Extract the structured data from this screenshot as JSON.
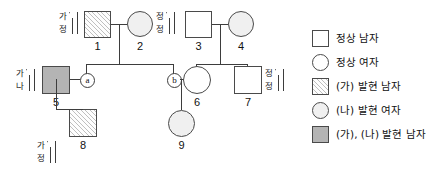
{
  "diagram": {
    "type": "pedigree-chart",
    "title": "",
    "individuals": [
      {
        "id": "1",
        "label": "1",
        "shape": "square",
        "sex": "male",
        "fill": "hatch",
        "phenotype": "(가) 발현 남자",
        "genotype_marker": {
          "position": "left",
          "top_allele": "가",
          "bottom_allele": "정",
          "chromosomes": [
            "Y",
            "X"
          ]
        }
      },
      {
        "id": "2",
        "label": "2",
        "shape": "circle",
        "sex": "female",
        "fill": "light",
        "phenotype": "(나) 발현 여자",
        "genotype_marker": null
      },
      {
        "id": "3",
        "label": "3",
        "shape": "square",
        "sex": "male",
        "fill": "open",
        "phenotype": "정상 남자",
        "genotype_marker": {
          "position": "left",
          "top_allele": "정",
          "bottom_allele": "정",
          "chromosomes": [
            "Y",
            "X"
          ]
        }
      },
      {
        "id": "4",
        "label": "4",
        "shape": "circle",
        "sex": "female",
        "fill": "light",
        "phenotype": "(나) 발현 여자",
        "genotype_marker": null
      },
      {
        "id": "5",
        "label": "5",
        "shape": "square",
        "sex": "male",
        "fill": "solid",
        "phenotype": "(가), (나) 발현 남자",
        "genotype_marker": {
          "position": "left",
          "top_allele": "가",
          "bottom_allele": "나",
          "chromosomes": [
            "Y",
            "X"
          ]
        }
      },
      {
        "id": "6",
        "label": "6",
        "shape": "circle",
        "sex": "female",
        "fill": "open",
        "phenotype": "정상 여자",
        "genotype_marker": null
      },
      {
        "id": "7",
        "label": "7",
        "shape": "square",
        "sex": "male",
        "fill": "open",
        "phenotype": "정상 남자",
        "genotype_marker": {
          "position": "right",
          "top_allele": "정",
          "bottom_allele": "정",
          "chromosomes": [
            "Y",
            "X"
          ]
        }
      },
      {
        "id": "8",
        "label": "8",
        "shape": "square",
        "sex": "male",
        "fill": "hatch",
        "phenotype": "(가) 발현 남자",
        "genotype_marker": {
          "position": "left",
          "top_allele": "가",
          "bottom_allele": "정",
          "chromosomes": [
            "Y",
            "X"
          ]
        }
      },
      {
        "id": "9",
        "label": "9",
        "shape": "circle",
        "sex": "female",
        "fill": "light",
        "phenotype": "(나) 발현 여자",
        "genotype_marker": null
      }
    ],
    "anonymous_members": [
      {
        "id": "a",
        "label": "ⓐ",
        "letter": "a",
        "shape": "circled-letter",
        "note": "딸, 1과 2의 자녀, 5의 배우자"
      },
      {
        "id": "b",
        "label": "ⓑ",
        "letter": "b",
        "shape": "circled-letter",
        "note": "아들, 1과 2의 자녀, 6의 배우자"
      }
    ],
    "matings": [
      {
        "id": "m1",
        "partners": [
          "1",
          "2"
        ],
        "children": [
          "a",
          "b"
        ]
      },
      {
        "id": "m2",
        "partners": [
          "3",
          "4"
        ],
        "children": [
          "6",
          "7"
        ]
      },
      {
        "id": "m3",
        "partners": [
          "5",
          "a"
        ],
        "children": [
          "8"
        ]
      },
      {
        "id": "m4",
        "partners": [
          "b",
          "6"
        ],
        "children": [
          "9"
        ]
      }
    ]
  },
  "legend": {
    "items": [
      {
        "key": "normal-male",
        "label": "정상 남자",
        "shape": "square",
        "fill": "open"
      },
      {
        "key": "normal-female",
        "label": "정상 여자",
        "shape": "circle",
        "fill": "open"
      },
      {
        "key": "ga-male",
        "label": "(가) 발현 남자",
        "shape": "square",
        "fill": "hatch"
      },
      {
        "key": "na-female",
        "label": "(나) 발현 여자",
        "shape": "circle",
        "fill": "light"
      },
      {
        "key": "ga-na-male",
        "label": "(가), (나) 발현 남자",
        "shape": "square",
        "fill": "solid"
      }
    ]
  },
  "colors": {
    "line": "#3d3d3d",
    "symbol_border": "#4a4a4a",
    "fill_open": "#ffffff",
    "fill_light": "#f0f0f0",
    "fill_solid": "#b4b4b4",
    "text": "#111111",
    "background": "#ffffff"
  }
}
